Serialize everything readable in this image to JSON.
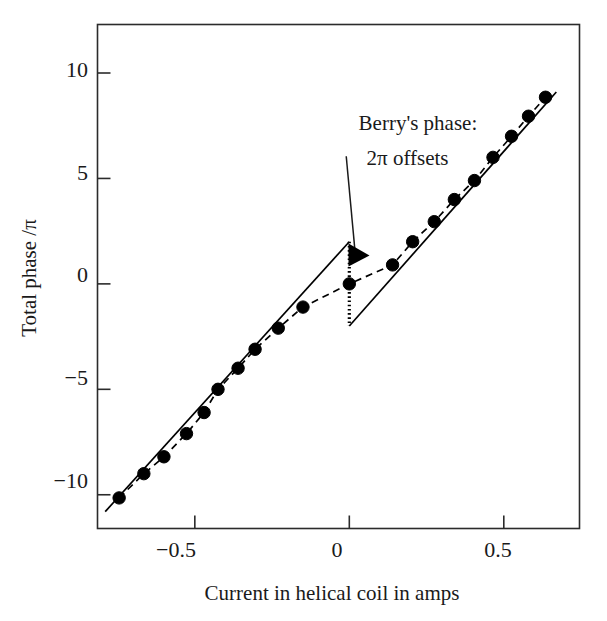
{
  "chart_data": {
    "type": "scatter",
    "title": "",
    "xlabel": "Current in helical coil in amps",
    "ylabel": "Total phase /π",
    "xlim": [
      -0.815,
      0.745
    ],
    "ylim": [
      -11.6,
      12.3
    ],
    "xticks": [
      -0.5,
      0,
      0.5
    ],
    "xtick_labels": [
      "−0.5",
      "0",
      "0.5"
    ],
    "yticks": [
      10,
      5,
      0,
      -5,
      -10
    ],
    "ytick_labels": [
      "10",
      "5",
      "0",
      "−5",
      "−10"
    ],
    "grid": false,
    "legend": "none",
    "series": [
      {
        "name": "measured total phase",
        "type": "scatter",
        "marker": "filled-circle",
        "color": "#000000",
        "x": [
          -0.745,
          -0.665,
          -0.6,
          -0.527,
          -0.47,
          -0.425,
          -0.36,
          -0.305,
          -0.23,
          -0.15,
          0.0,
          0.14,
          0.205,
          0.275,
          0.34,
          0.405,
          0.465,
          0.525,
          0.58,
          0.635
        ],
        "y": [
          -10.15,
          -9.0,
          -8.2,
          -7.1,
          -6.1,
          -5.0,
          -4.0,
          -3.1,
          -2.1,
          -1.1,
          0.0,
          0.9,
          2.0,
          2.95,
          4.0,
          4.9,
          6.0,
          7.0,
          7.95,
          8.85
        ]
      },
      {
        "name": "dashed fit through data",
        "type": "line",
        "style": "dashed",
        "color": "#000000",
        "x": [
          -0.745,
          -0.665,
          -0.6,
          -0.527,
          -0.47,
          -0.425,
          -0.36,
          -0.305,
          -0.23,
          -0.15,
          0.0,
          0.14,
          0.205,
          0.275,
          0.34,
          0.405,
          0.465,
          0.525,
          0.58,
          0.635
        ],
        "y": [
          -10.15,
          -9.0,
          -8.2,
          -7.1,
          -6.1,
          -5.0,
          -4.0,
          -3.1,
          -2.1,
          -1.1,
          0.0,
          0.9,
          2.0,
          2.95,
          4.0,
          4.9,
          6.0,
          7.0,
          7.95,
          8.85
        ]
      },
      {
        "name": "solid dynamic-phase line (lower branch)",
        "type": "line",
        "style": "solid",
        "color": "#000000",
        "x": [
          -0.79,
          0.0
        ],
        "y": [
          -10.8,
          2.0
        ]
      },
      {
        "name": "solid dynamic-phase line (upper branch)",
        "type": "line",
        "style": "solid",
        "color": "#000000",
        "x": [
          0.0,
          0.67
        ],
        "y": [
          -2.0,
          9.1
        ]
      },
      {
        "name": "2pi offset jump",
        "type": "line",
        "style": "dotted",
        "color": "#000000",
        "x": [
          0.0,
          0.0
        ],
        "y": [
          2.0,
          -2.0
        ]
      }
    ],
    "annotations": [
      {
        "name": "berrys-phase-annotation",
        "text_lines": [
          "Berry's phase:",
          "2π offsets"
        ],
        "text_x": 0.03,
        "text_y": 7.3,
        "arrow_from_x": -0.01,
        "arrow_from_y": 6.05,
        "arrow_to_x": 0.02,
        "arrow_to_y": 1.3,
        "arrow_head": "filled-triangle-right"
      }
    ]
  },
  "axis": {
    "frame_color": "#2b2b2b",
    "tick_direction": "in"
  },
  "labels": {
    "xlabel": "Current in helical coil in amps",
    "ylabel": "Total phase /π",
    "annot_line1": "Berry's phase:",
    "annot_line2": "2π offsets",
    "xtick_0": "−0.5",
    "xtick_1": "0",
    "xtick_2": "0.5",
    "ytick_0": "10",
    "ytick_1": "5",
    "ytick_2": "0",
    "ytick_3": "−5",
    "ytick_4": "−10"
  }
}
